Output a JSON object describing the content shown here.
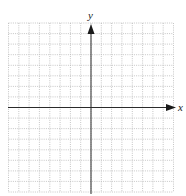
{
  "diagram": {
    "type": "coordinate-plane",
    "x_axis_label": "x",
    "y_axis_label": "y",
    "grid": {
      "cells_left": 8,
      "cells_right": 8,
      "cells_up": 8,
      "cells_down": 8,
      "line_style": "dotted",
      "line_color": "#b8b8b8"
    },
    "axis_color": "#2a2a2a"
  }
}
